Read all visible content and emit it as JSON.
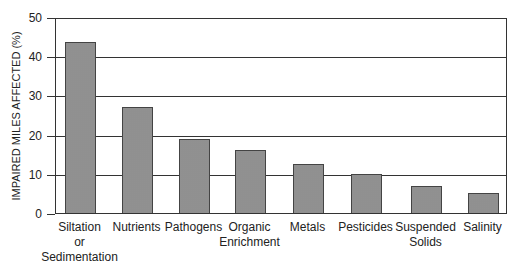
{
  "chart_data": {
    "type": "bar",
    "title": "",
    "xlabel": "",
    "ylabel": "IMPAIRED MILES AFFECTED (%)",
    "ylim": [
      0,
      50
    ],
    "yticks": [
      "0",
      "10",
      "20",
      "30",
      "40",
      "50"
    ],
    "grid": true,
    "legend": null,
    "categories": [
      "Siltation or Sedimentation",
      "Nutrients",
      "Pathogens",
      "Organic Enrichment",
      "Metals",
      "Pesticides",
      "Suspended Solids",
      "Salinity"
    ],
    "category_lines": [
      [
        "Siltation",
        "or",
        "Sedimentation"
      ],
      [
        "Nutrients"
      ],
      [
        "Pathogens"
      ],
      [
        "Organic",
        "Enrichment"
      ],
      [
        "Metals"
      ],
      [
        "Pesticides"
      ],
      [
        "Suspended",
        "Solids"
      ],
      [
        "Salinity"
      ]
    ],
    "values": [
      43.5,
      27,
      19,
      16,
      12.5,
      10,
      7,
      5
    ],
    "bar_color": "#a6a6a6"
  }
}
